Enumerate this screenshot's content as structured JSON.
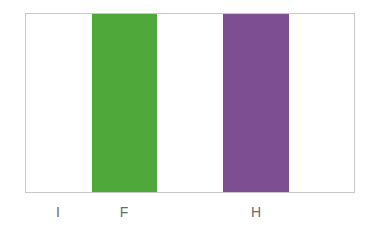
{
  "diagram": {
    "type": "vertical-stripes",
    "stripes": [
      {
        "label": "I",
        "color": "#ffffff",
        "position": 1
      },
      {
        "label": "F",
        "color": "#4ea83a",
        "position": 2
      },
      {
        "label": "",
        "color": "#ffffff",
        "position": 3
      },
      {
        "label": "H",
        "color": "#7e4e92",
        "position": 4
      },
      {
        "label": "",
        "color": "#ffffff",
        "position": 5
      }
    ],
    "labels": [
      "I",
      "F",
      "H"
    ]
  }
}
